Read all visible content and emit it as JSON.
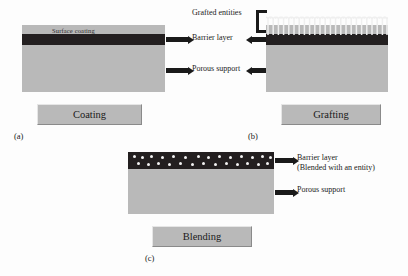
{
  "figure": {
    "panels": [
      {
        "key": "coating",
        "sublabel": "(a)",
        "caption": "Coating",
        "surface_label": "Surface coating",
        "annotations": [
          "Barrier layer",
          "Porous support"
        ]
      },
      {
        "key": "grafting",
        "sublabel": "(b)",
        "caption": "Grafting",
        "annotations": [
          "Grafted entities",
          "Barrier layer",
          "Porous support"
        ]
      },
      {
        "key": "blending",
        "sublabel": "(c)",
        "caption": "Blending",
        "annotations": [
          "Barrier layer",
          "(Blended with an entity)",
          "Porous support"
        ]
      }
    ],
    "labels": {
      "surface_coating": "Surface coating",
      "grafted_entities": "Grafted entities",
      "barrier_layer": "Barrier layer",
      "porous_support": "Porous support",
      "barrier_layer_blended_line1": "Barrier layer",
      "barrier_layer_blended_line2": "(Blended with an entity)",
      "caption_a": "Coating",
      "caption_b": "Grafting",
      "caption_c": "Blending",
      "sub_a": "(a)",
      "sub_b": "(b)",
      "sub_c": "(c)"
    },
    "colors": {
      "support": "#b9b9b9",
      "barrier": "#231f20",
      "caption_box": "#b9b9b9",
      "graft_bristle": "#efefef",
      "blend_particle": "#f2f2f2",
      "background": "#fdfdfd",
      "text": "#1a1a1a"
    }
  }
}
